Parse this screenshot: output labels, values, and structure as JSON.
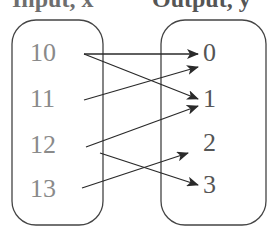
{
  "headers": {
    "input": "Input, x",
    "output": "Output, y"
  },
  "inputs": [
    {
      "label": "10",
      "x": 30,
      "y": 40
    },
    {
      "label": "11",
      "x": 30,
      "y": 86
    },
    {
      "label": "12",
      "x": 30,
      "y": 132
    },
    {
      "label": "13",
      "x": 30,
      "y": 176
    }
  ],
  "outputs": [
    {
      "label": "0",
      "x": 203,
      "y": 40
    },
    {
      "label": "1",
      "x": 203,
      "y": 86
    },
    {
      "label": "2",
      "x": 203,
      "y": 130
    },
    {
      "label": "3",
      "x": 203,
      "y": 172
    }
  ],
  "mappings": [
    {
      "from": "10",
      "to": "0",
      "x1": 84,
      "y1": 54,
      "x2": 198,
      "y2": 54
    },
    {
      "from": "10",
      "to": "1",
      "x1": 84,
      "y1": 54,
      "x2": 198,
      "y2": 99
    },
    {
      "from": "11",
      "to": "0",
      "x1": 84,
      "y1": 100,
      "x2": 198,
      "y2": 67
    },
    {
      "from": "12",
      "to": "1",
      "x1": 86,
      "y1": 147,
      "x2": 198,
      "y2": 106
    },
    {
      "from": "12",
      "to": "3",
      "x1": 100,
      "y1": 153,
      "x2": 198,
      "y2": 185
    },
    {
      "from": "13",
      "to": "2",
      "x1": 82,
      "y1": 188,
      "x2": 188,
      "y2": 153
    }
  ],
  "colors": {
    "line": "#2a2a2a",
    "box": "#444444",
    "input_text": "#8a8a8a",
    "output_text": "#555555"
  }
}
